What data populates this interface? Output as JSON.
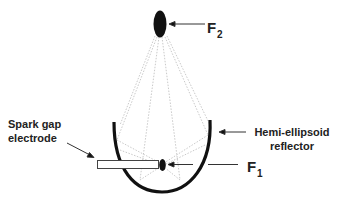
{
  "diagram": {
    "labels": {
      "f2": "F",
      "f2_sub": "2",
      "f1": "F",
      "f1_sub": "1",
      "spark_line1": "Spark gap",
      "spark_line2": "electrode",
      "reflector_line1": "Hemi-ellipsoid",
      "reflector_line2": "reflector"
    },
    "colors": {
      "ink": "#111111",
      "rays": "#bbbbbb"
    }
  }
}
